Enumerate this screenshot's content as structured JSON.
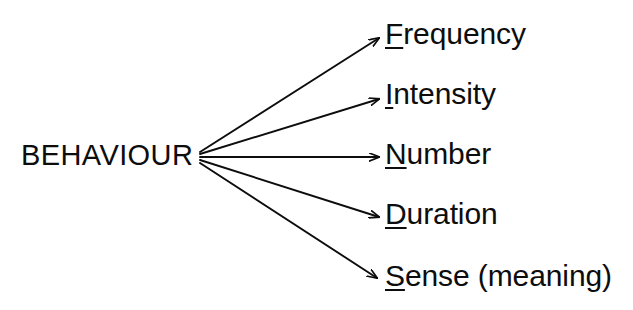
{
  "diagram": {
    "type": "radial-fan-tree",
    "background_color": "#ffffff",
    "ink_color": "#0d0d0d",
    "root": {
      "label": "BEHAVIOUR",
      "x": 21,
      "y": 141
    },
    "fan_origin": {
      "x": 199,
      "y": 157
    },
    "leaves": [
      {
        "id": "frequency",
        "initial": "F",
        "rest": "requency",
        "full_text": "Frequency",
        "underlined_initial": true,
        "label_x": 385,
        "label_y": 19,
        "arrow_tip_x": 381,
        "arrow_tip_y": 37
      },
      {
        "id": "intensity",
        "initial": "I",
        "rest": "ntensity",
        "full_text": "Intensity",
        "underlined_initial": true,
        "label_x": 385,
        "label_y": 79,
        "arrow_tip_x": 381,
        "arrow_tip_y": 98
      },
      {
        "id": "number",
        "initial": "N",
        "rest": "umber",
        "full_text": "Number",
        "underlined_initial": true,
        "label_x": 385,
        "label_y": 139,
        "arrow_tip_x": 381,
        "arrow_tip_y": 157
      },
      {
        "id": "duration",
        "initial": "D",
        "rest": "uration",
        "full_text": "Duration",
        "underlined_initial": true,
        "label_x": 385,
        "label_y": 199,
        "arrow_tip_x": 381,
        "arrow_tip_y": 217
      },
      {
        "id": "sense",
        "initial": "S",
        "rest": "ense (meaning)",
        "full_text": "Sense (meaning)",
        "underlined_initial": true,
        "label_x": 385,
        "label_y": 261,
        "arrow_tip_x": 379,
        "arrow_tip_y": 278
      }
    ]
  }
}
